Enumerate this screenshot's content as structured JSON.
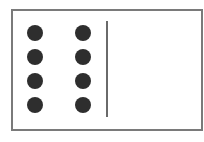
{
  "diagram": {
    "frame": {
      "border_color": "#7a7a7a",
      "background": "#ffffff"
    },
    "dots": {
      "count": 8,
      "columns": 2,
      "rows": 4,
      "color": "#2e2e2e",
      "items": [
        {
          "col": 1,
          "row": 1
        },
        {
          "col": 2,
          "row": 1
        },
        {
          "col": 1,
          "row": 2
        },
        {
          "col": 2,
          "row": 2
        },
        {
          "col": 1,
          "row": 3
        },
        {
          "col": 2,
          "row": 3
        },
        {
          "col": 1,
          "row": 4
        },
        {
          "col": 2,
          "row": 4
        }
      ]
    },
    "divider": {
      "orientation": "vertical",
      "color": "#6a6a6a"
    },
    "right_region": {
      "content": ""
    }
  }
}
